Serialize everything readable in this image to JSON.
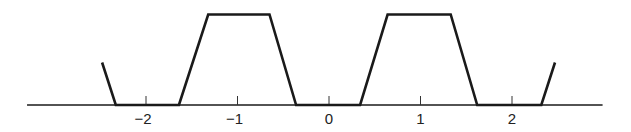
{
  "chart_data": {
    "type": "line",
    "title": "",
    "xlabel": "",
    "ylabel": "",
    "xlim": [
      -3.3,
      3.0
    ],
    "ylim": [
      0,
      1
    ],
    "grid": false,
    "legend": null,
    "x_ticks": [
      -2,
      -1,
      0,
      1,
      2
    ],
    "x_tick_labels": [
      "−2",
      "−1",
      "0",
      "1",
      "2"
    ],
    "series": [
      {
        "name": "periodic trapezoidal waveform",
        "color": "#1a1a1a",
        "x": [
          -2.48,
          -2.33,
          -1.63,
          -1.64,
          -1.32,
          -0.65,
          -0.36,
          0.34,
          0.64,
          1.33,
          1.62,
          2.32,
          2.47
        ],
        "y": [
          0.47,
          0.0,
          0.0,
          0.0,
          1.0,
          1.0,
          0.0,
          0.0,
          1.0,
          1.0,
          0.0,
          0.0,
          0.47
        ]
      }
    ],
    "axis": {
      "x_start": -3.3,
      "x_end": 2.99,
      "color": "#1a1a1a"
    }
  }
}
